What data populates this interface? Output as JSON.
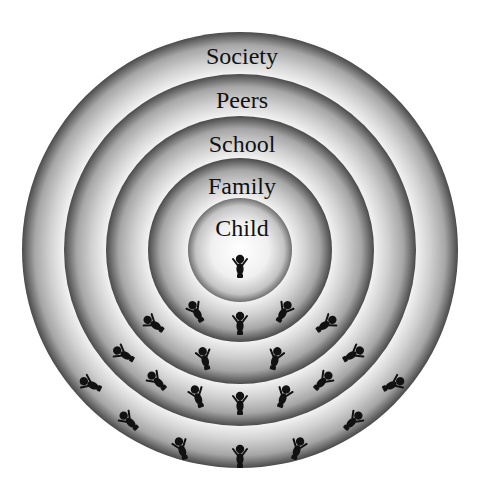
{
  "diagram": {
    "type": "concentric-circles",
    "center": [
      240,
      250
    ],
    "rings": [
      {
        "label": "Society",
        "radius": 218,
        "label_y": 44
      },
      {
        "label": "Peers",
        "radius": 176,
        "label_y": 88
      },
      {
        "label": "School",
        "radius": 134,
        "label_y": 132
      },
      {
        "label": "Family",
        "radius": 92,
        "label_y": 174
      },
      {
        "label": "Child",
        "radius": 52,
        "label_y": 216
      }
    ],
    "colors": {
      "ring_light": "#f2f2f2",
      "ring_mid": "#b8b8b8",
      "ring_dark": "#4a4a4a",
      "figure": "#111111",
      "text": "#111111"
    },
    "figures": [
      {
        "x": 240,
        "y": 268,
        "rot": 0,
        "ring": "Child"
      },
      {
        "x": 197,
        "y": 313,
        "rot": -30,
        "ring": "Family"
      },
      {
        "x": 240,
        "y": 325,
        "rot": 0,
        "ring": "Family"
      },
      {
        "x": 283,
        "y": 313,
        "rot": 30,
        "ring": "Family"
      },
      {
        "x": 155,
        "y": 325,
        "rot": -55,
        "ring": "School"
      },
      {
        "x": 325,
        "y": 325,
        "rot": 55,
        "ring": "School"
      },
      {
        "x": 205,
        "y": 360,
        "rot": -15,
        "ring": "School"
      },
      {
        "x": 275,
        "y": 360,
        "rot": 15,
        "ring": "School"
      },
      {
        "x": 125,
        "y": 355,
        "rot": -60,
        "ring": "Peers"
      },
      {
        "x": 352,
        "y": 355,
        "rot": 60,
        "ring": "Peers"
      },
      {
        "x": 158,
        "y": 382,
        "rot": -45,
        "ring": "Peers"
      },
      {
        "x": 322,
        "y": 382,
        "rot": 45,
        "ring": "Peers"
      },
      {
        "x": 198,
        "y": 398,
        "rot": -20,
        "ring": "Peers"
      },
      {
        "x": 240,
        "y": 405,
        "rot": 0,
        "ring": "Peers"
      },
      {
        "x": 283,
        "y": 398,
        "rot": 20,
        "ring": "Peers"
      },
      {
        "x": 92,
        "y": 385,
        "rot": -65,
        "ring": "Society"
      },
      {
        "x": 392,
        "y": 385,
        "rot": 65,
        "ring": "Society"
      },
      {
        "x": 130,
        "y": 422,
        "rot": -45,
        "ring": "Society"
      },
      {
        "x": 352,
        "y": 422,
        "rot": 45,
        "ring": "Society"
      },
      {
        "x": 182,
        "y": 450,
        "rot": -20,
        "ring": "Society"
      },
      {
        "x": 240,
        "y": 458,
        "rot": 0,
        "ring": "Society"
      },
      {
        "x": 297,
        "y": 450,
        "rot": 20,
        "ring": "Society"
      }
    ]
  }
}
